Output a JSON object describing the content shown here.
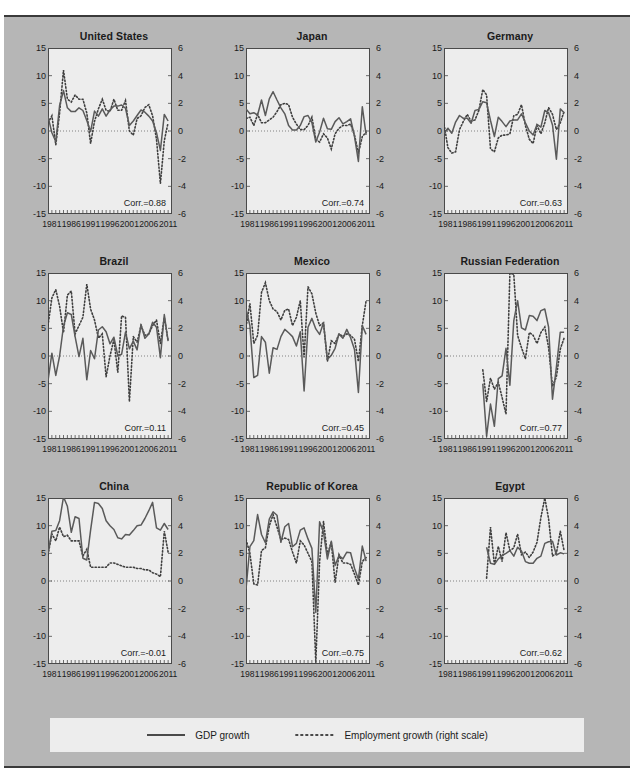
{
  "figure": {
    "background_color": "#b6b6b6",
    "panel_background_color": "#ededed",
    "line_color": "#4a4a4a",
    "rule_color": "#3a3a3a"
  },
  "legend": {
    "gdp_label": "GDP growth",
    "employment_label": "Employment growth (right scale)",
    "gdp_style": "solid",
    "employment_style": "dotted"
  },
  "axes": {
    "left_ticks": [
      "15",
      "10",
      "5",
      "0",
      "-5",
      "-10",
      "-15"
    ],
    "left_values": [
      15,
      10,
      5,
      0,
      -5,
      -10,
      -15
    ],
    "right_ticks": [
      "6",
      "4",
      "2",
      "0",
      "-2",
      "-4",
      "-6"
    ],
    "right_values": [
      6,
      4,
      2,
      0,
      -2,
      -4,
      -6
    ],
    "x_ticks": [
      "1981",
      "1986",
      "1991",
      "1996",
      "2001",
      "2006",
      "2011"
    ],
    "x_values": [
      1981,
      1986,
      1991,
      1996,
      2001,
      2006,
      2011
    ],
    "xlim": [
      1980,
      2012
    ],
    "ylim_left": [
      -15,
      15
    ],
    "ylim_right": [
      -6,
      6
    ],
    "corr_prefix": "Corr.="
  },
  "chart_data": {
    "type": "line",
    "title": "",
    "xlabel": "",
    "ylabel": "",
    "ylim": [
      -15,
      15
    ],
    "ylim_right": [
      -6,
      6
    ],
    "xlim": [
      1980,
      2012
    ],
    "grid": false,
    "legend_position": "bottom",
    "series_names": [
      "GDP growth",
      "Employment growth (right scale)"
    ],
    "panels": [
      {
        "name": "United States",
        "corr": "0.88",
        "x": [
          1980,
          1981,
          1982,
          1983,
          1984,
          1985,
          1986,
          1987,
          1988,
          1989,
          1990,
          1991,
          1992,
          1993,
          1994,
          1995,
          1996,
          1997,
          1998,
          1999,
          2000,
          2001,
          2002,
          2003,
          2004,
          2005,
          2006,
          2007,
          2008,
          2009,
          2010,
          2011
        ],
        "gdp": [
          2.6,
          -0.3,
          -1.9,
          4.6,
          7.3,
          4.2,
          3.5,
          3.5,
          4.2,
          3.7,
          1.9,
          -0.1,
          3.6,
          2.7,
          4.0,
          2.7,
          3.8,
          4.5,
          4.5,
          4.7,
          4.1,
          1.0,
          1.8,
          2.8,
          3.8,
          3.4,
          2.7,
          1.8,
          -0.3,
          -3.5,
          3.0,
          1.8
        ],
        "emp": [
          0.6,
          1.1,
          -1.0,
          1.3,
          4.4,
          2.3,
          2.1,
          2.6,
          2.3,
          2.3,
          1.3,
          -0.9,
          0.7,
          1.6,
          2.3,
          1.5,
          1.4,
          2.3,
          1.5,
          1.5,
          2.2,
          0.0,
          -0.3,
          0.9,
          1.1,
          1.7,
          1.9,
          1.1,
          -0.6,
          -3.8,
          -0.7,
          0.6
        ]
      },
      {
        "name": "Japan",
        "corr": "0.74",
        "x": [
          1980,
          1981,
          1982,
          1983,
          1984,
          1985,
          1986,
          1987,
          1988,
          1989,
          1990,
          1991,
          1992,
          1993,
          1994,
          1995,
          1996,
          1997,
          1998,
          1999,
          2000,
          2001,
          2002,
          2003,
          2004,
          2005,
          2006,
          2007,
          2008,
          2009,
          2010,
          2011
        ],
        "gdp": [
          4.0,
          3.1,
          3.3,
          2.9,
          5.6,
          2.8,
          5.8,
          7.1,
          5.6,
          4.2,
          3.1,
          1.0,
          0.2,
          0.2,
          1.0,
          2.6,
          2.8,
          1.5,
          -2.0,
          -0.2,
          2.3,
          0.4,
          0.3,
          1.7,
          2.4,
          1.3,
          1.7,
          2.2,
          -1.0,
          -5.5,
          4.4,
          -0.7
        ],
        "emp": [
          0.9,
          1.0,
          0.4,
          1.2,
          0.6,
          0.6,
          0.8,
          1.0,
          1.4,
          1.9,
          2.0,
          1.9,
          1.0,
          0.5,
          0.1,
          0.1,
          0.4,
          1.0,
          -0.6,
          -0.8,
          -0.2,
          -0.5,
          -1.3,
          -0.2,
          0.2,
          0.4,
          0.4,
          0.5,
          -0.3,
          -1.6,
          -0.4,
          -0.1
        ]
      },
      {
        "name": "Germany",
        "corr": "0.63",
        "x": [
          1980,
          1981,
          1982,
          1983,
          1984,
          1985,
          1986,
          1987,
          1988,
          1989,
          1990,
          1991,
          1992,
          1993,
          1994,
          1995,
          1996,
          1997,
          1998,
          1999,
          2000,
          2001,
          2002,
          2003,
          2004,
          2005,
          2006,
          2007,
          2008,
          2009,
          2010,
          2011
        ],
        "gdp": [
          -0.4,
          0.5,
          -0.4,
          1.6,
          2.8,
          2.3,
          2.3,
          1.4,
          3.7,
          3.9,
          5.3,
          5.1,
          1.9,
          -1.0,
          2.5,
          1.7,
          0.8,
          1.8,
          2.0,
          2.0,
          3.1,
          1.5,
          0.0,
          -0.7,
          1.2,
          0.7,
          3.7,
          3.3,
          1.1,
          -5.1,
          4.0,
          3.3
        ],
        "emp": [
          0.5,
          -1.2,
          -1.6,
          -1.5,
          0.1,
          0.7,
          1.2,
          0.7,
          0.8,
          1.5,
          3.0,
          2.6,
          -1.3,
          -1.5,
          -0.5,
          -0.3,
          -0.3,
          -0.2,
          1.1,
          1.2,
          1.9,
          0.4,
          -0.6,
          -0.9,
          0.4,
          -0.2,
          0.6,
          1.7,
          1.2,
          0.1,
          0.6,
          1.4
        ]
      },
      {
        "name": "Brazil",
        "corr": "0.11",
        "x": [
          1980,
          1981,
          1982,
          1983,
          1984,
          1985,
          1986,
          1987,
          1988,
          1989,
          1990,
          1991,
          1992,
          1993,
          1994,
          1995,
          1996,
          1997,
          1998,
          1999,
          2000,
          2001,
          2002,
          2003,
          2004,
          2005,
          2006,
          2007,
          2008,
          2009,
          2010,
          2011
        ],
        "gdp": [
          -4.5,
          0.5,
          -3.5,
          0.0,
          5.4,
          7.8,
          7.5,
          3.5,
          -0.1,
          3.2,
          -4.3,
          1.0,
          -0.5,
          4.7,
          5.3,
          4.4,
          2.2,
          3.4,
          0.0,
          0.3,
          4.3,
          1.3,
          2.7,
          1.1,
          5.7,
          3.2,
          4.0,
          6.1,
          5.2,
          -0.3,
          7.5,
          2.7
        ],
        "emp": [
          2.2,
          4.2,
          4.8,
          3.6,
          1.7,
          4.4,
          4.7,
          1.6,
          2.2,
          2.8,
          5.2,
          3.4,
          2.6,
          1.3,
          1.6,
          -1.5,
          0.0,
          1.2,
          -1.2,
          2.9,
          2.8,
          -3.3,
          1.4,
          1.0,
          2.2,
          1.5,
          1.6,
          2.2,
          2.6,
          0.9,
          2.8,
          1.1
        ]
      },
      {
        "name": "Mexico",
        "corr": "0.45",
        "x": [
          1980,
          1981,
          1982,
          1983,
          1984,
          1985,
          1986,
          1987,
          1988,
          1989,
          1990,
          1991,
          1992,
          1993,
          1994,
          1995,
          1996,
          1997,
          1998,
          1999,
          2000,
          2001,
          2002,
          2003,
          2004,
          2005,
          2006,
          2007,
          2008,
          2009,
          2010,
          2011
        ],
        "gdp": [
          8.5,
          5.5,
          -3.9,
          -3.5,
          3.5,
          2.5,
          -3.1,
          1.5,
          1.2,
          3.5,
          4.8,
          4.2,
          3.5,
          1.8,
          4.4,
          -6.3,
          5.2,
          6.8,
          4.9,
          3.9,
          6.0,
          -0.6,
          0.1,
          1.4,
          4.0,
          3.2,
          4.8,
          3.3,
          1.2,
          -6.6,
          5.5,
          3.9
        ],
        "emp": [
          2.1,
          3.8,
          0.9,
          1.5,
          4.6,
          5.3,
          4.0,
          3.4,
          3.2,
          2.6,
          3.3,
          3.4,
          2.2,
          2.8,
          4.0,
          -0.1,
          5.0,
          4.5,
          3.1,
          2.2,
          2.4,
          -0.4,
          1.1,
          0.9,
          1.6,
          1.4,
          1.6,
          1.5,
          1.2,
          -0.4,
          2.2,
          4.0
        ]
      },
      {
        "name": "Russian Federation",
        "corr": "0.77",
        "x": [
          1990,
          1991,
          1992,
          1993,
          1994,
          1995,
          1996,
          1997,
          1998,
          1999,
          2000,
          2001,
          2002,
          2003,
          2004,
          2005,
          2006,
          2007,
          2008,
          2009,
          2010,
          2011
        ],
        "gdp": [
          -5.0,
          -14.5,
          -8.7,
          -12.7,
          -4.1,
          -3.6,
          1.4,
          -5.3,
          6.4,
          10.0,
          5.1,
          4.7,
          7.3,
          7.2,
          6.4,
          8.2,
          8.5,
          5.2,
          -7.8,
          -2.0,
          4.3,
          4.3
        ],
        "emp": [
          -1.0,
          -3.3,
          -1.6,
          -2.4,
          -1.9,
          -3.0,
          -4.2,
          6.0,
          5.9,
          1.5,
          0.6,
          -0.2,
          1.7,
          1.5,
          0.9,
          1.7,
          2.1,
          0.6,
          -2.2,
          -1.5,
          0.5,
          1.3
        ]
      },
      {
        "name": "China",
        "corr": "-0.01",
        "x": [
          1980,
          1981,
          1982,
          1983,
          1984,
          1985,
          1986,
          1987,
          1988,
          1989,
          1990,
          1991,
          1992,
          1993,
          1994,
          1995,
          1996,
          1997,
          1998,
          1999,
          2000,
          2001,
          2002,
          2003,
          2004,
          2005,
          2006,
          2007,
          2008,
          2009,
          2010,
          2011
        ],
        "gdp": [
          5.0,
          9.0,
          9.1,
          10.9,
          15.2,
          13.5,
          8.8,
          11.6,
          11.3,
          4.1,
          3.8,
          9.2,
          14.2,
          14.0,
          13.1,
          10.9,
          10.0,
          9.3,
          7.8,
          7.6,
          8.4,
          8.3,
          9.1,
          10.0,
          10.1,
          11.3,
          12.7,
          14.2,
          9.6,
          9.2,
          10.4,
          9.3
        ],
        "emp": [
          1.9,
          3.4,
          2.9,
          3.9,
          3.2,
          3.3,
          2.9,
          2.9,
          2.9,
          1.8,
          2.3,
          1.0,
          1.0,
          1.0,
          1.0,
          1.0,
          1.3,
          1.3,
          1.2,
          1.1,
          1.0,
          1.0,
          1.0,
          0.9,
          0.9,
          0.8,
          0.8,
          0.6,
          0.5,
          0.3,
          3.6,
          2.1
        ]
      },
      {
        "name": "Republic of Korea",
        "corr": "0.75",
        "x": [
          1980,
          1981,
          1982,
          1983,
          1984,
          1985,
          1986,
          1987,
          1988,
          1989,
          1990,
          1991,
          1992,
          1993,
          1994,
          1995,
          1996,
          1997,
          1998,
          1999,
          2000,
          2001,
          2002,
          2003,
          2004,
          2005,
          2006,
          2007,
          2008,
          2009,
          2010,
          2011
        ],
        "gdp": [
          -1.5,
          6.2,
          7.3,
          12.0,
          8.4,
          6.9,
          11.2,
          12.5,
          11.9,
          7.0,
          9.8,
          10.4,
          6.2,
          6.8,
          9.2,
          9.6,
          7.6,
          5.9,
          -5.7,
          10.7,
          8.8,
          4.0,
          7.2,
          2.8,
          4.6,
          4.0,
          5.2,
          5.1,
          2.3,
          0.3,
          6.3,
          3.6
        ],
        "emp": [
          3.0,
          2.0,
          -0.2,
          -0.3,
          2.2,
          2.4,
          4.0,
          4.8,
          3.9,
          3.0,
          3.1,
          3.0,
          2.1,
          1.3,
          2.9,
          2.6,
          2.0,
          1.4,
          -5.9,
          1.4,
          4.3,
          1.9,
          2.8,
          -0.1,
          1.9,
          1.3,
          1.3,
          1.2,
          0.5,
          -0.3,
          1.4,
          1.7
        ]
      },
      {
        "name": "Egypt",
        "corr": "0.62",
        "x": [
          1991,
          1992,
          1993,
          1994,
          1995,
          1996,
          1997,
          1998,
          1999,
          2000,
          2001,
          2002,
          2003,
          2004,
          2005,
          2006,
          2007,
          2008,
          2009,
          2010,
          2011
        ],
        "gdp": [
          6.1,
          3.2,
          3.0,
          4.0,
          4.6,
          5.0,
          5.5,
          4.5,
          6.1,
          5.4,
          3.5,
          3.2,
          3.2,
          4.1,
          4.5,
          6.8,
          7.1,
          7.2,
          4.7,
          5.1,
          4.9
        ],
        "emp": [
          0.2,
          3.9,
          1.2,
          2.5,
          1.4,
          3.5,
          2.2,
          2.4,
          3.4,
          1.9,
          2.1,
          1.7,
          2.1,
          2.8,
          4.6,
          6.0,
          4.5,
          1.8,
          2.0,
          3.6,
          2.2
        ]
      }
    ]
  }
}
